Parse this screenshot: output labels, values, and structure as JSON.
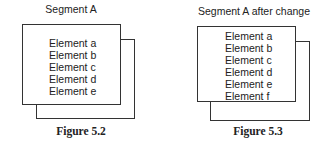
{
  "figures": [
    {
      "title": "Segment A",
      "elements": [
        "Element a",
        "Element b",
        "Element c",
        "Element d",
        "Element e"
      ],
      "caption": "Figure 5.2"
    },
    {
      "title": "Segment A after change",
      "elements": [
        "Element a",
        "Element b",
        "Element c",
        "Element d",
        "Element e",
        "Element f"
      ],
      "caption": "Figure 5.3"
    }
  ]
}
